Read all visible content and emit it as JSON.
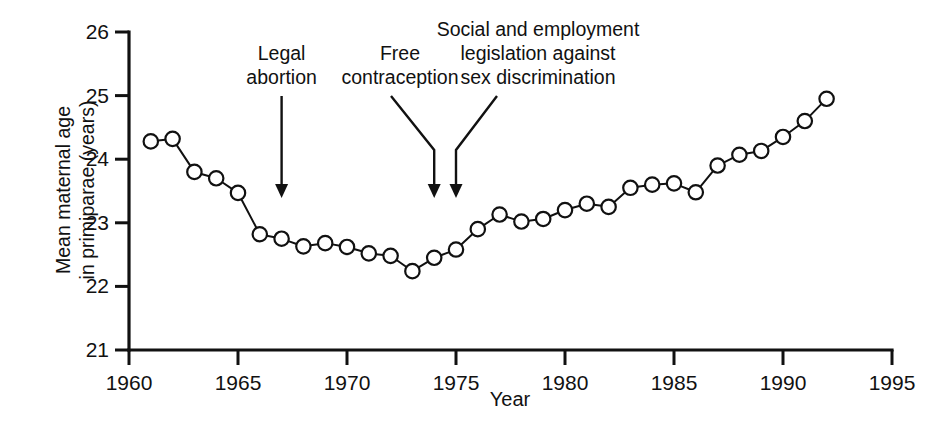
{
  "chart_data": {
    "type": "line",
    "title": "",
    "xlabel": "Year",
    "ylabel": "Mean maternal age\nin primiparae (years)",
    "xlim": [
      1960,
      1995
    ],
    "ylim": [
      21,
      26
    ],
    "grid": false,
    "legend": "none",
    "xticks": [
      "1960",
      "1965",
      "1970",
      "1975",
      "1980",
      "1985",
      "1990",
      "1995"
    ],
    "xtick_values": [
      1960,
      1965,
      1970,
      1975,
      1980,
      1985,
      1990,
      1995
    ],
    "yticks": [
      "21",
      "22",
      "23",
      "24",
      "25",
      "26"
    ],
    "ytick_values": [
      21,
      22,
      23,
      24,
      25,
      26
    ],
    "marker": "open-circle",
    "x": [
      1961,
      1962,
      1963,
      1964,
      1965,
      1966,
      1967,
      1968,
      1969,
      1970,
      1971,
      1972,
      1973,
      1974,
      1975,
      1976,
      1977,
      1978,
      1979,
      1980,
      1981,
      1982,
      1983,
      1984,
      1985,
      1986,
      1987,
      1988,
      1989,
      1990,
      1991,
      1992
    ],
    "values": [
      24.28,
      24.32,
      23.8,
      23.7,
      23.47,
      22.82,
      22.75,
      22.63,
      22.68,
      22.62,
      22.52,
      22.48,
      22.24,
      22.45,
      22.58,
      22.9,
      23.13,
      23.02,
      23.06,
      23.2,
      23.3,
      23.25,
      23.55,
      23.6,
      23.62,
      23.48,
      23.9,
      24.07,
      24.13,
      24.35,
      24.6,
      24.95
    ],
    "annotations": [
      {
        "id": "legal-abortion",
        "text": "Legal\nabortion",
        "target_year": 1967,
        "style": "straight-down"
      },
      {
        "id": "free-contraception",
        "text": "Free\ncontraception",
        "target_year": 1974,
        "style": "bent-right"
      },
      {
        "id": "sex-discrimination-legislation",
        "text": "Social and employment\nlegislation against\nsex discrimination",
        "target_year": 1975,
        "style": "bent-left"
      }
    ]
  },
  "colors": {
    "axis": "#111111",
    "line": "#111111",
    "marker_fill": "#ffffff",
    "background": "#ffffff"
  }
}
